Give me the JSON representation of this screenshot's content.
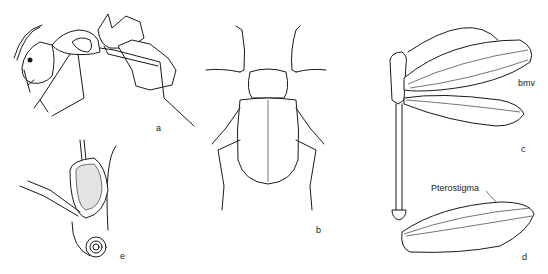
{
  "figure": {
    "panels": [
      {
        "id": "a",
        "label": "a",
        "subject": "ant (lateral view)"
      },
      {
        "id": "b",
        "label": "b",
        "subject": "beetle (dorsal view)"
      },
      {
        "id": "c",
        "label": "c",
        "subject": "lacewing (dorsal view, wings spread)"
      },
      {
        "id": "d",
        "label": "d",
        "subject": "lacewing wing"
      },
      {
        "id": "e",
        "label": "e",
        "subject": "head with coiled proboscis"
      }
    ],
    "annotations": {
      "bmv": "bmv",
      "pterostigma": "Pterostigma"
    }
  }
}
